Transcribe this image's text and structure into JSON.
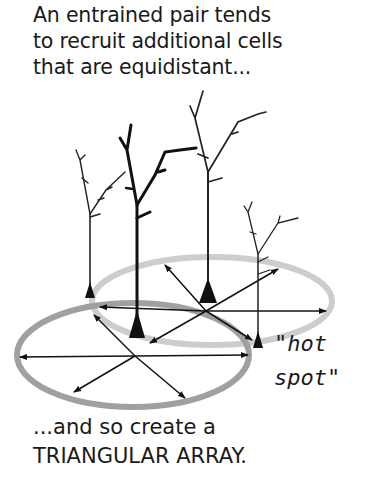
{
  "caption_top": {
    "lines": [
      "An entrained pair tends",
      "to recruit additional cells",
      "that are equidistant..."
    ]
  },
  "label_hot_spot": {
    "lines": [
      "\"hot",
      "spot\""
    ]
  },
  "caption_bottom": {
    "lines": [
      "...and so create a",
      "TRIANGULAR ARRAY."
    ]
  },
  "diagram": {
    "neurons": [
      {
        "id": "left-back",
        "soma": [
          90,
          292
        ]
      },
      {
        "id": "center-front-entrained",
        "soma": [
          137,
          330
        ]
      },
      {
        "id": "center-back-entrained",
        "soma": [
          208,
          300
        ]
      },
      {
        "id": "right-hot-spot",
        "soma": [
          258,
          345
        ]
      }
    ],
    "ellipses": [
      {
        "id": "lower-range",
        "color": "#9a9a9a"
      },
      {
        "id": "upper-range",
        "color": "#c8c8c8"
      }
    ]
  }
}
